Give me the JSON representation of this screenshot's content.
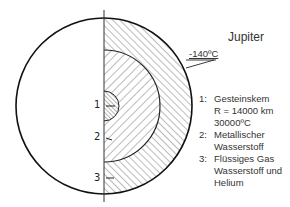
{
  "diagram": {
    "title": "Jupiter",
    "surface_temperature": "-140ºC",
    "markers": [
      "1",
      "2",
      "3"
    ],
    "legend": [
      {
        "number": "1:",
        "lines": [
          "Gesteinskem",
          "R = 14000 km",
          "30000ºC"
        ]
      },
      {
        "number": "2:",
        "lines": [
          "Metallischer",
          "Wasserstoff"
        ]
      },
      {
        "number": "3:",
        "lines": [
          "Flüssiges Gas",
          "Wasserstoff und",
          "Helium"
        ]
      }
    ]
  }
}
